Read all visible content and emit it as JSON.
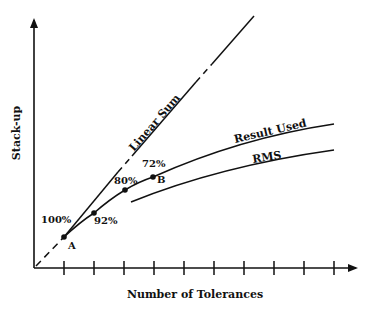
{
  "chart_data": {
    "type": "line",
    "title": "",
    "xlabel": "Number of Tolerances",
    "ylabel": "Stack-up",
    "grid": false,
    "legend": "none",
    "x_ticks": 10,
    "curves": [
      {
        "name": "Linear Sum",
        "label": "Linear Sum",
        "style": "mixed solid/dashed"
      },
      {
        "name": "Result Used",
        "label": "Result Used",
        "style": "solid"
      },
      {
        "name": "RMS",
        "label": "RMS",
        "style": "solid"
      }
    ],
    "points": [
      {
        "label": "A",
        "percent": "100%",
        "tick": 1
      },
      {
        "label": "",
        "percent": "92%",
        "tick": 2
      },
      {
        "label": "",
        "percent": "80%",
        "tick": 3
      },
      {
        "label": "B",
        "percent": "72%",
        "tick": 4
      }
    ],
    "annotations": [
      "100%",
      "92%",
      "80%",
      "72%",
      "A",
      "B"
    ]
  },
  "colors": {
    "ink": "#111111",
    "background": "#ffffff"
  }
}
